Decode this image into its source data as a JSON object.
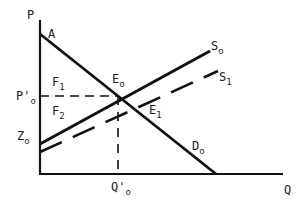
{
  "axes": {
    "y_label": "P",
    "x_label": "Q"
  },
  "labels": {
    "A": "A",
    "E0_main": "E",
    "E0_sub": "o",
    "E1_main": "E",
    "E1_sub": "1",
    "S0_main": "S",
    "S0_sub": "o",
    "S1_main": "S",
    "S1_sub": "1",
    "D0_main": "D",
    "D0_sub": "o",
    "F1_main": "F",
    "F1_sub": "1",
    "F2_main": "F",
    "F2_sub": "2",
    "P0_main": "P'",
    "P0_sub": "o",
    "Z0_main": "Z",
    "Z0_sub": "o",
    "Q0_main": "Q'",
    "Q0_sub": "o"
  },
  "lines": {
    "demand": {
      "name": "D0",
      "style": "solid"
    },
    "supply0": {
      "name": "S0",
      "style": "solid"
    },
    "supply1": {
      "name": "S1",
      "style": "dashed"
    },
    "price_guide": {
      "name": "P0'",
      "style": "dashed"
    },
    "quantity_guide": {
      "name": "Q0'",
      "style": "dashed"
    }
  },
  "colors": {
    "line": "#111111",
    "background": "#ffffff"
  }
}
